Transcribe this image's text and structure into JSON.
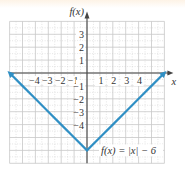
{
  "chart_data": {
    "type": "line",
    "title": "",
    "xlabel": "x",
    "ylabel": "f(x)",
    "function_label": "f(x) = |x| − 6",
    "xlim": [
      -6,
      6
    ],
    "ylim": [
      -7,
      4
    ],
    "grid": true,
    "x_ticks": [
      "−4",
      "−3",
      "−2",
      "−1",
      "1",
      "2",
      "3",
      "4"
    ],
    "y_ticks": [
      "3",
      "2",
      "1",
      "−1",
      "−2",
      "−3",
      "−4"
    ],
    "series": [
      {
        "name": "f(x) = |x| − 6",
        "color": "#2f8fc4",
        "x": [
          -6,
          -5,
          -4,
          -3,
          -2,
          -1,
          0,
          1,
          2,
          3,
          4,
          5,
          6
        ],
        "y": [
          0,
          -1,
          -2,
          -3,
          -4,
          -5,
          -6,
          -5,
          -4,
          -3,
          -2,
          -1,
          0
        ],
        "arrows_both_ends": true
      }
    ]
  },
  "colors": {
    "line": "#2f8fc4",
    "grid": "#c8c8c8",
    "axis": "#444444",
    "top_strip": "#fdf3e6"
  }
}
